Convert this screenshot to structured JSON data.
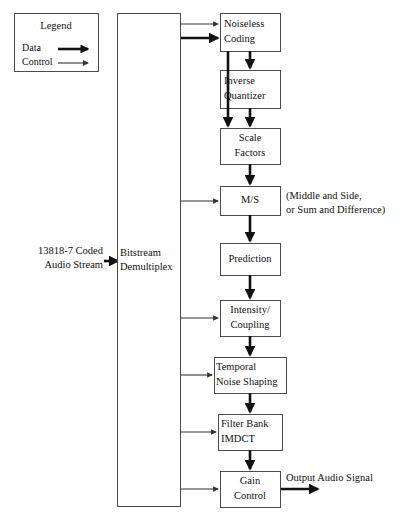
{
  "canvas": {
    "width": 407,
    "height": 520,
    "background": "#ffffff"
  },
  "colors": {
    "box_stroke": "#4a4a4a",
    "box_fill": "#ffffff",
    "data_line": "#111111",
    "control_line": "#333333",
    "text": "#111111"
  },
  "legend": {
    "title": "Legend",
    "entries": [
      {
        "label": "Data",
        "style": "data"
      },
      {
        "label": "Control",
        "style": "control"
      }
    ],
    "box": {
      "x": 14,
      "y": 13,
      "w": 84,
      "h": 58
    }
  },
  "labels": {
    "input_stream_line1": "13818-7 Coded",
    "input_stream_line2": "Audio Stream",
    "ms_note_line1": "(Middle and Side,",
    "ms_note_line2": "or Sum and Difference)",
    "output_signal": "Output Audio Signal"
  },
  "blocks": [
    {
      "id": "demux",
      "lines": [
        "Bitstream",
        "Demultiplex"
      ],
      "x": 117,
      "y": 13,
      "w": 63,
      "h": 493,
      "align": "start",
      "text_x": 120
    },
    {
      "id": "noiseless",
      "lines": [
        "Noiseless",
        "Coding"
      ],
      "x": 220,
      "y": 13,
      "w": 60,
      "h": 38,
      "align": "start",
      "text_x": 224
    },
    {
      "id": "invquant",
      "lines": [
        "Inverse",
        "Quantizer"
      ],
      "x": 220,
      "y": 70,
      "w": 60,
      "h": 38,
      "align": "start",
      "text_x": 224
    },
    {
      "id": "scale",
      "lines": [
        "Scale",
        "Factors"
      ],
      "x": 220,
      "y": 128,
      "w": 60,
      "h": 36,
      "align": "center",
      "text_x": 250
    },
    {
      "id": "ms",
      "lines": [
        "M/S"
      ],
      "x": 220,
      "y": 186,
      "w": 60,
      "h": 29,
      "align": "center",
      "text_x": 250
    },
    {
      "id": "prediction",
      "lines": [
        "Prediction"
      ],
      "x": 220,
      "y": 243,
      "w": 60,
      "h": 32,
      "align": "center",
      "text_x": 250
    },
    {
      "id": "intensity",
      "lines": [
        "Intensity/",
        "Coupling"
      ],
      "x": 220,
      "y": 300,
      "w": 60,
      "h": 36,
      "align": "center",
      "text_x": 250
    },
    {
      "id": "tns",
      "lines": [
        "Temporal",
        "Noise Shaping"
      ],
      "x": 214,
      "y": 357,
      "w": 72,
      "h": 36,
      "align": "start",
      "text_x": 216
    },
    {
      "id": "filterbank",
      "lines": [
        "Filter Bank",
        "IMDCT"
      ],
      "x": 218,
      "y": 414,
      "w": 64,
      "h": 36,
      "align": "start",
      "text_x": 221
    },
    {
      "id": "gain",
      "lines": [
        "Gain",
        "Control"
      ],
      "x": 220,
      "y": 471,
      "w": 60,
      "h": 36,
      "align": "center",
      "text_x": 250
    }
  ],
  "connections": [
    {
      "id": "input-to-demux",
      "style": "data",
      "from": "external-left",
      "to": "demux"
    },
    {
      "id": "demux-to-noiseless-a",
      "style": "control",
      "from": "demux",
      "to": "noiseless"
    },
    {
      "id": "demux-to-noiseless-b",
      "style": "data",
      "from": "demux",
      "to": "noiseless"
    },
    {
      "id": "noiseless-to-invquant",
      "style": "data",
      "from": "noiseless",
      "to": "invquant"
    },
    {
      "id": "noiseless-to-scale",
      "style": "data",
      "from": "noiseless",
      "to": "scale"
    },
    {
      "id": "invquant-to-scale",
      "style": "data",
      "from": "invquant",
      "to": "scale"
    },
    {
      "id": "scale-to-ms",
      "style": "data",
      "from": "scale",
      "to": "ms"
    },
    {
      "id": "demux-to-ms",
      "style": "control",
      "from": "demux",
      "to": "ms"
    },
    {
      "id": "ms-to-prediction",
      "style": "data",
      "from": "ms",
      "to": "prediction"
    },
    {
      "id": "prediction-to-intensity",
      "style": "data",
      "from": "prediction",
      "to": "intensity"
    },
    {
      "id": "demux-to-intensity",
      "style": "control",
      "from": "demux",
      "to": "intensity"
    },
    {
      "id": "intensity-to-tns",
      "style": "data",
      "from": "intensity",
      "to": "tns"
    },
    {
      "id": "demux-to-tns",
      "style": "control",
      "from": "demux",
      "to": "tns"
    },
    {
      "id": "tns-to-filterbank",
      "style": "data",
      "from": "tns",
      "to": "filterbank"
    },
    {
      "id": "demux-to-filterbank",
      "style": "control",
      "from": "demux",
      "to": "filterbank"
    },
    {
      "id": "filterbank-to-gain",
      "style": "data",
      "from": "filterbank",
      "to": "gain"
    },
    {
      "id": "demux-to-gain",
      "style": "control",
      "from": "demux",
      "to": "gain"
    },
    {
      "id": "gain-to-output",
      "style": "data",
      "from": "gain",
      "to": "external-right"
    }
  ]
}
